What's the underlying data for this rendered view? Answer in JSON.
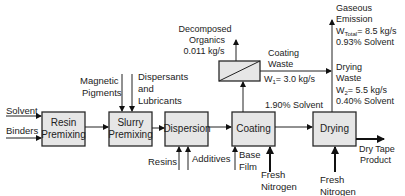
{
  "diagram": {
    "units": {
      "resin_premixing": {
        "line1": "Resin",
        "line2": "Premixing"
      },
      "slurry_premixing": {
        "line1": "Slurry",
        "line2": "Premixing"
      },
      "dispersion": {
        "label": "Dispersion"
      },
      "coating": {
        "label": "Coating"
      },
      "drying": {
        "label": "Drying"
      }
    },
    "inputs": {
      "solvent": "Solvent",
      "binders": "Binders",
      "magnetic_pigments": {
        "line1": "Magnetic",
        "line2": "Pigments"
      },
      "dispersants": {
        "line1": "Dispersants",
        "line2": "and",
        "line3": "Lubricants"
      },
      "resins": "Resins",
      "additives": "Additives",
      "base_film": {
        "line1": "Base",
        "line2": "Film"
      },
      "coating_nitrogen": {
        "line1": "Fresh",
        "line2": "Nitrogen"
      },
      "drying_nitrogen": {
        "line1": "Fresh",
        "line2": "Nitrogen"
      }
    },
    "streams": {
      "decomposed_organics": {
        "line1": "Decomposed",
        "line2": "Organics",
        "line3": "0.011 kg/s"
      },
      "coating_waste": {
        "line1": "Coating",
        "line2": "Waste",
        "flow_prefix": "W",
        "flow_sub": "1",
        "flow_value": "= 3.0 kg/s"
      },
      "coating_solvent": "1.90% Solvent",
      "gaseous_emission": {
        "line1": "Gaseous",
        "line2": "Emission",
        "flow_prefix": "W",
        "flow_sub": "Total",
        "flow_value": "= 8.5 kg/s",
        "solvent": "0.93% Solvent"
      },
      "drying_waste": {
        "line1": "Drying",
        "line2": "Waste",
        "flow_prefix": "W",
        "flow_sub": "2",
        "flow_value": "= 5.5 kg/s",
        "solvent": "0.40% Solvent"
      },
      "product": {
        "line1": "Dry Tape",
        "line2": "Product"
      }
    }
  }
}
